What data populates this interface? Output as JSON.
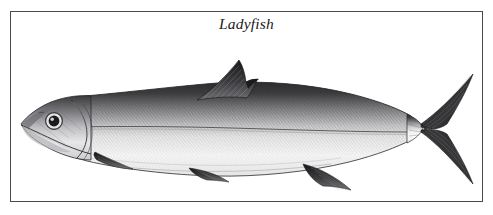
{
  "plate": {
    "width": 493,
    "height": 215,
    "background_color": "#ffffff",
    "border_color": "#4a4a4c",
    "caption": "Ladyfish",
    "caption_style": "italic-serif",
    "subject": "ladyfish",
    "illustration_style": "black-and-white engraving",
    "ink_color": "#1a1a1a"
  },
  "figure": {
    "common_name": "Ladyfish",
    "orientation": "left-facing lateral view",
    "parts": [
      {
        "name": "head",
        "label": "head"
      },
      {
        "name": "eye",
        "label": "eye"
      },
      {
        "name": "mouth",
        "label": "mouth"
      },
      {
        "name": "gill-cover",
        "label": "operculum"
      },
      {
        "name": "dorsal-fin",
        "label": "dorsal fin"
      },
      {
        "name": "pectoral-fin",
        "label": "pectoral fin"
      },
      {
        "name": "pelvic-fin",
        "label": "pelvic fin"
      },
      {
        "name": "anal-fin",
        "label": "anal fin"
      },
      {
        "name": "caudal-fin",
        "label": "caudal fin"
      },
      {
        "name": "lateral-line",
        "label": "lateral line"
      },
      {
        "name": "body",
        "label": "body"
      }
    ]
  }
}
